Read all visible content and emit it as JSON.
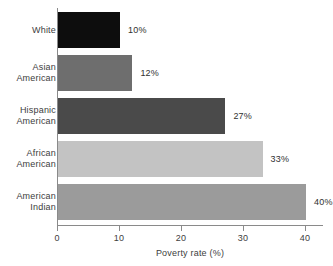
{
  "chart_data": {
    "type": "bar",
    "orientation": "horizontal",
    "title": "",
    "subtitle": "",
    "xlabel": "Poverty rate (%)",
    "ylabel": "",
    "categories": [
      "White",
      "Asian American",
      "Hispanic American",
      "African American",
      "American Indian"
    ],
    "category_lines": [
      [
        "White"
      ],
      [
        "Asian",
        "American"
      ],
      [
        "Hispanic",
        "American"
      ],
      [
        "African",
        "American"
      ],
      [
        "American",
        "Indian"
      ]
    ],
    "values": [
      10,
      12,
      27,
      33,
      40
    ],
    "value_labels": [
      "10%",
      "12%",
      "27%",
      "33%",
      "40%"
    ],
    "bar_colors": [
      "#0d0d0d",
      "#6e6e6e",
      "#4a4a4a",
      "#c3c3c3",
      "#9b9b9b"
    ],
    "xlim": [
      0,
      40
    ],
    "xticks": [
      0,
      10,
      20,
      30,
      40
    ],
    "xtick_labels": [
      "0",
      "10",
      "20",
      "30",
      "40"
    ],
    "grid": false,
    "legend": false,
    "axis_color": "#8a8a8a",
    "background": "#ffffff"
  }
}
